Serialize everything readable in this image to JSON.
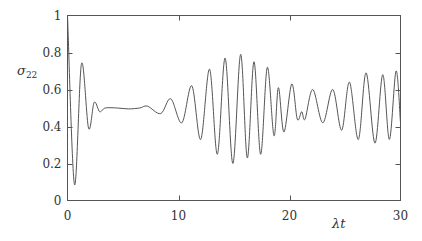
{
  "chart_data": {
    "type": "line",
    "title": "",
    "xlabel": "λt",
    "ylabel": "σ",
    "ylabel_sub": "22",
    "xlim": [
      0,
      30
    ],
    "ylim": [
      0,
      1
    ],
    "grid": false,
    "legend": "none",
    "x_ticks": [
      0,
      10,
      20,
      30
    ],
    "x_tick_labels": [
      "0",
      "10",
      "20",
      "30"
    ],
    "y_ticks": [
      0,
      0.2,
      0.4,
      0.6,
      0.8,
      1
    ],
    "y_tick_labels": [
      "0",
      "0.2",
      "0.4",
      "0.6",
      "0.8",
      "1"
    ],
    "series": [
      {
        "name": "sigma22",
        "x": [
          0,
          0.63,
          1.26,
          1.9,
          2.4,
          2.9,
          3.4,
          4.5,
          5.5,
          6.5,
          7.2,
          8.4,
          9.3,
          10.3,
          11.2,
          12.0,
          12.8,
          13.5,
          14.2,
          14.9,
          15.6,
          16.2,
          16.8,
          17.4,
          18.0,
          18.6,
          19.0,
          19.5,
          20.2,
          20.7,
          21.1,
          21.4,
          22.1,
          23.0,
          23.9,
          24.7,
          25.4,
          26.2,
          26.9,
          27.7,
          28.4,
          29.0,
          29.6,
          30
        ],
        "y": [
          1.0,
          0.086,
          0.74,
          0.39,
          0.53,
          0.48,
          0.5,
          0.5,
          0.495,
          0.5,
          0.51,
          0.47,
          0.55,
          0.42,
          0.62,
          0.33,
          0.71,
          0.25,
          0.77,
          0.2,
          0.79,
          0.23,
          0.75,
          0.25,
          0.72,
          0.35,
          0.61,
          0.37,
          0.63,
          0.44,
          0.48,
          0.44,
          0.6,
          0.42,
          0.6,
          0.38,
          0.64,
          0.33,
          0.69,
          0.31,
          0.68,
          0.33,
          0.7,
          0.42
        ]
      }
    ]
  }
}
